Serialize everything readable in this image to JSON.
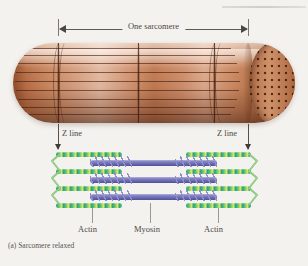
{
  "figure": {
    "caption_prefix": "(a)",
    "caption_text": "Sarcomere relaxed",
    "caption_full": "(a) Sarcomere relaxed"
  },
  "span": {
    "label": "One sarcomere"
  },
  "callouts": {
    "z_line_left": "Z line",
    "z_line_right": "Z line"
  },
  "labels": {
    "actin_left": "Actin",
    "myosin": "Myosin",
    "actin_right": "Actin"
  },
  "colors": {
    "background": "#f4f2ef",
    "fiber_mid": "#c07c53",
    "fiber_light": "#e7c2ab",
    "fiber_dark": "#7d4224",
    "actin_green": "#3fa776",
    "actin_highlight": "#d8e86a",
    "myosin_purple": "#6f6fb4",
    "myosin_head": "#8f8fcb",
    "z_line_green": "#74bb84",
    "text": "#4b4845",
    "leader": "#9b9894"
  },
  "structure": {
    "actin_rows": 4,
    "myosin_rows": 3,
    "fiber_striations": 9
  }
}
